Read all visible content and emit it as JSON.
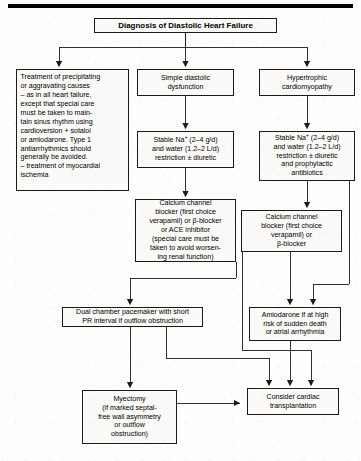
{
  "diagram": {
    "type": "flowchart",
    "title": "Diagnosis of Diastolic Heart Failure",
    "nodes": {
      "title": {
        "id": "diagnosis",
        "label": "Diagnosis of Diastolic Heart Failure"
      },
      "treatment_precipitating": {
        "id": "treatment-precipitating-causes",
        "label": "Treatment of precipitating\nor aggravating causes\n– as in all heart failure,\n   except that special care\n   must be taken to main-\n   tain sinus rhythm using\n   cardioversion + sotalol\n   or amiodarone. Type 1\n   antiarrhythmics should\n   generally be avoided.\n– treatment of myocardial\n   ischemia"
      },
      "simple_diastolic": {
        "id": "simple-diastolic-dysfunction",
        "label": "Simple diastolic\ndysfunction"
      },
      "hypertrophic": {
        "id": "hypertrophic-cardiomyopathy",
        "label": "Hypertrophic\ncardiomyopathy"
      },
      "sodium_mid": {
        "id": "stable-sodium-water-restriction-mid",
        "label": "Stable Na+ (2–4 g/d)\nand water (1.2–2 L/d)\nrestriction ± diuretic"
      },
      "sodium_right": {
        "id": "stable-sodium-water-restriction-right",
        "label": "Stable Na+ (2–4 g/d)\nand water (1.2–2 L/d)\nrestriction ± diuretic\nand prophylactic\nantibiotics"
      },
      "ccb_mid": {
        "id": "calcium-channel-blocker-ace",
        "label": "Calcium channel\nblocker (first choice\nverapamil) or β-blocker\nor ACE inhibitor\n(special care must be\ntaken to avoid worsen-\ning renal function)"
      },
      "ccb_right": {
        "id": "calcium-channel-blocker-beta",
        "label": "Calcium channel\nblocker (first choice\nverapamil) or\nβ-blocker"
      },
      "pacemaker": {
        "id": "dual-chamber-pacemaker",
        "label": "Dual chamber pacemaker with short\nPR interval if outflow obstruction"
      },
      "amiodarone": {
        "id": "amiodarone-high-risk",
        "label": "Amiodarone if at high\nrisk of sudden death\nor atrial arrhythmia"
      },
      "myectomy": {
        "id": "myectomy",
        "label": "Myectomy\n(if marked septal-\nfree wall asymmetry\nor outflow\nobstruction)"
      },
      "transplant": {
        "id": "consider-cardiac-transplantation",
        "label": "Consider cardiac\ntransplantation"
      }
    },
    "edges": [
      {
        "from": "diagnosis",
        "to": "treatment-precipitating-causes"
      },
      {
        "from": "diagnosis",
        "to": "simple-diastolic-dysfunction"
      },
      {
        "from": "diagnosis",
        "to": "hypertrophic-cardiomyopathy"
      },
      {
        "from": "simple-diastolic-dysfunction",
        "to": "stable-sodium-water-restriction-mid"
      },
      {
        "from": "stable-sodium-water-restriction-mid",
        "to": "calcium-channel-blocker-ace"
      },
      {
        "from": "hypertrophic-cardiomyopathy",
        "to": "stable-sodium-water-restriction-right"
      },
      {
        "from": "stable-sodium-water-restriction-right",
        "to": "calcium-channel-blocker-beta"
      },
      {
        "from": "calcium-channel-blocker-ace",
        "to": "dual-chamber-pacemaker"
      },
      {
        "from": "calcium-channel-blocker-beta",
        "to": "amiodarone-high-risk"
      },
      {
        "from": "stable-sodium-water-restriction-right",
        "to": "amiodarone-high-risk"
      },
      {
        "from": "dual-chamber-pacemaker",
        "to": "myectomy"
      },
      {
        "from": "dual-chamber-pacemaker",
        "to": "consider-cardiac-transplantation"
      },
      {
        "from": "amiodarone-high-risk",
        "to": "consider-cardiac-transplantation"
      },
      {
        "from": "calcium-channel-blocker-beta",
        "to": "consider-cardiac-transplantation"
      },
      {
        "from": "myectomy",
        "to": "consider-cardiac-transplantation"
      }
    ],
    "style": {
      "box_border": "#1b1b1b",
      "box_fill": "#fbfaf8",
      "line": "#1b1b1b",
      "text": "#000000",
      "page_background": "#fdfdfc"
    }
  }
}
